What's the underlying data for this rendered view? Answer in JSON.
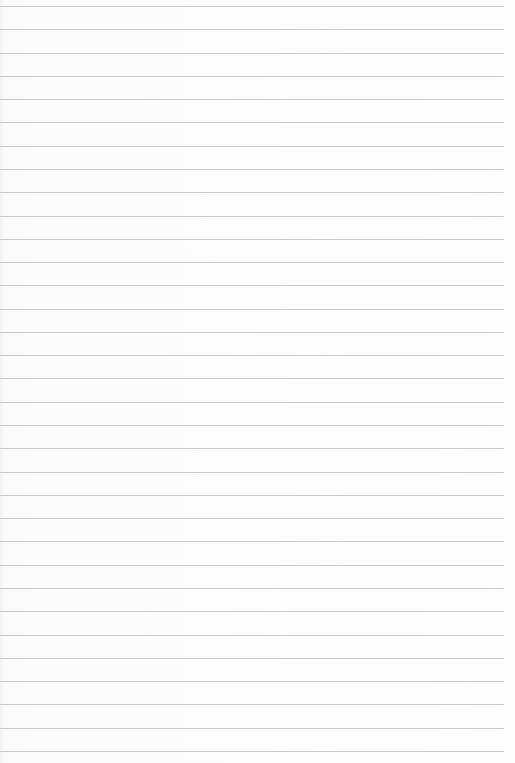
{
  "paper": {
    "type": "lined-paper",
    "line_count": 33,
    "first_line_y": 6,
    "line_spacing": 23.28,
    "line_width": 504,
    "line_color": "#c9c9c9",
    "background_color": "#fdfdfd"
  }
}
